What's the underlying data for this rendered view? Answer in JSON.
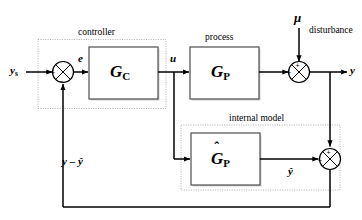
{
  "diagram": {
    "stroke_color": "#000000",
    "block_border_color": "#555555",
    "group_border_color": "#999999",
    "background": "#ffffff"
  },
  "groups": [
    {
      "id": "controller",
      "label": "controller"
    },
    {
      "id": "internal_model",
      "label": "internal model"
    }
  ],
  "blocks": [
    {
      "id": "gc",
      "glyph": "G",
      "subscript": "C",
      "hat": false,
      "group": "controller"
    },
    {
      "id": "gp",
      "glyph": "G",
      "subscript": "P",
      "hat": false,
      "group": "process"
    },
    {
      "id": "gp_hat",
      "glyph": "G",
      "subscript": "P",
      "hat": true,
      "hat_glyph": "ˆ",
      "group": "internal_model"
    }
  ],
  "block_group_labels": {
    "process": "process"
  },
  "signals": {
    "setpoint": {
      "glyph": "y",
      "subscript": "s"
    },
    "error": {
      "glyph": "e",
      "subscript": ""
    },
    "control": {
      "glyph": "u",
      "subscript": ""
    },
    "disturbance": {
      "glyph": "μ",
      "label": "disturbance"
    },
    "output": {
      "glyph": "y",
      "subscript": ""
    },
    "model_output": {
      "glyph": "ŷ",
      "subscript": ""
    },
    "feedback": {
      "glyph": "y – ŷ",
      "subscript": ""
    }
  },
  "summing_junctions": [
    {
      "id": "error-junction",
      "inputs": [
        {
          "from": "setpoint",
          "sign": "+"
        },
        {
          "from": "feedback",
          "sign": "–"
        }
      ]
    },
    {
      "id": "disturbance-junction",
      "inputs": [
        {
          "from": "process-output",
          "sign": "+"
        },
        {
          "from": "disturbance",
          "sign": "+"
        }
      ]
    },
    {
      "id": "model-error-junction",
      "inputs": [
        {
          "from": "model_output",
          "sign": "–"
        },
        {
          "from": "output",
          "sign": "+"
        }
      ]
    }
  ]
}
